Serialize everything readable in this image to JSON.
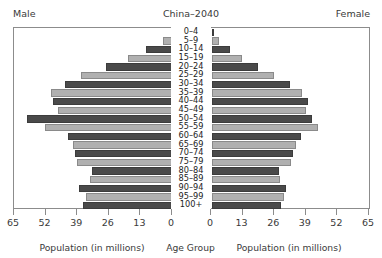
{
  "header": {
    "male_label": "Male",
    "title": "China–2040",
    "female_label": "Female"
  },
  "axis": {
    "ticks": [
      65,
      52,
      39,
      26,
      13,
      0
    ],
    "left_caption": "Population (in millions)",
    "center_caption": "Age Group",
    "right_caption": "Population (in millions)"
  },
  "colors": {
    "dark_bar": "#4a4a4a",
    "light_bar": "#b0b0b0",
    "frame": "#8c8c8c",
    "text": "#3a3a3a",
    "background": "#ffffff"
  },
  "chart_data": {
    "type": "bar",
    "subtype": "population-pyramid",
    "title": "China–2040",
    "xlabel": "Population (in millions)",
    "ylabel": "Age Group",
    "xlim": [
      0,
      65
    ],
    "grid": false,
    "left_series_name": "Male",
    "right_series_name": "Female",
    "categories": [
      "0–4",
      "5–9",
      "10–14",
      "15–19",
      "20–24",
      "25–29",
      "30–34",
      "35–39",
      "40–44",
      "45–49",
      "50–54",
      "55–59",
      "60–64",
      "65–69",
      "70–74",
      "75–79",
      "80–84",
      "85–89",
      "90–94",
      "95–99",
      "100+"
    ],
    "series": [
      {
        "name": "Male",
        "values": [
          37.0,
          36.0,
          38.5,
          34.0,
          33.5,
          39.5,
          40.5,
          41.0,
          43.0,
          52.5,
          60.0,
          47.5,
          49.5,
          50.0,
          44.5,
          38.0,
          27.5,
          18.5,
          11.0,
          4.0,
          0.8
        ]
      },
      {
        "name": "Female",
        "values": [
          28.5,
          29.5,
          30.5,
          28.0,
          27.5,
          32.5,
          33.5,
          34.5,
          36.5,
          43.5,
          41.0,
          38.5,
          39.5,
          37.0,
          32.0,
          25.5,
          19.0,
          12.5,
          7.5,
          3.0,
          0.6
        ]
      }
    ]
  }
}
